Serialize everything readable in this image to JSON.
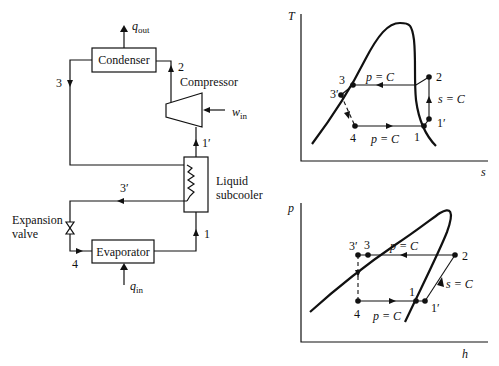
{
  "schematic": {
    "components": {
      "condenser": "Condenser",
      "compressor": "Compressor",
      "liquid_subcooler_line1": "Liquid",
      "liquid_subcooler_line2": "subcooler",
      "expansion_valve_line1": "Expansion",
      "expansion_valve_line2": "valve",
      "evaporator": "Evaporator"
    },
    "energy": {
      "q_out_base": "q",
      "q_out_sub": "out",
      "w_in_base": "w",
      "w_in_sub": "in",
      "q_in_base": "q",
      "q_in_sub": "in"
    },
    "states": {
      "s1": "1",
      "s1p": "1′",
      "s2": "2",
      "s3": "3",
      "s3p": "3′",
      "s4": "4"
    }
  },
  "ts_diagram": {
    "y_axis": "T",
    "x_axis": "s",
    "labels": {
      "p_const_top": "p = C",
      "p_const_bottom": "p = C",
      "s_const": "s = C",
      "s1": "1",
      "s1p": "1′",
      "s2": "2",
      "s3": "3",
      "s3p": "3′",
      "s4": "4"
    }
  },
  "ph_diagram": {
    "y_axis": "p",
    "x_axis": "h",
    "labels": {
      "p_const_top": "p = C",
      "p_const_bottom": "p = C",
      "s_const": "s = C",
      "s1": "1",
      "s1p": "1′",
      "s2": "2",
      "s3": "3",
      "s3p": "3′",
      "s4": "4"
    }
  },
  "colors": {
    "line": "#111111",
    "background": "#ffffff"
  }
}
